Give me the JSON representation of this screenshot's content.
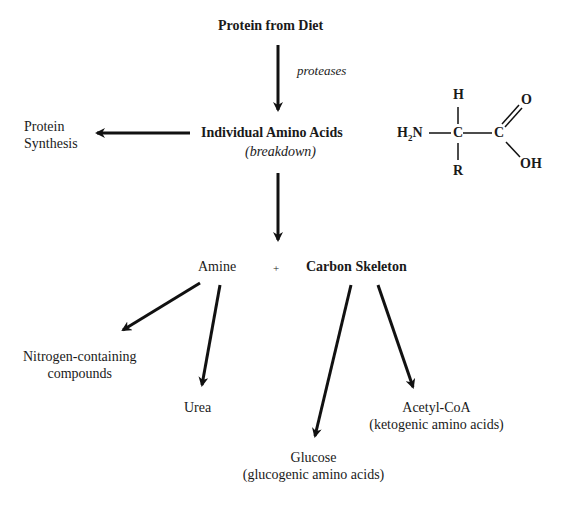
{
  "diagram": {
    "top_node": "Protein from Diet",
    "edge_label_proteases": "proteases",
    "center_node": "Individual Amino Acids",
    "center_note": "(breakdown)",
    "left_node_line1": "Protein",
    "left_node_line2": "Synthesis",
    "amine_node": "Amine",
    "plus": "+",
    "carbon_node": "Carbon Skeleton",
    "nitrogen_line1": "Nitrogen-containing",
    "nitrogen_line2": "compounds",
    "urea_node": "Urea",
    "glucose_line1": "Glucose",
    "glucose_line2": "(glucogenic amino acids)",
    "acetyl_line1": "Acetyl-CoA",
    "acetyl_line2": "(ketogenic amino acids)"
  },
  "structure": {
    "H_top": "H",
    "H2N": "H",
    "H2N_sub": "2",
    "H2N_N": "N",
    "C_alpha": "C",
    "C_carboxyl": "C",
    "O": "O",
    "OH": "OH",
    "R": "R"
  },
  "colors": {
    "text": "#1a1a1a",
    "arrow": "#111111"
  }
}
